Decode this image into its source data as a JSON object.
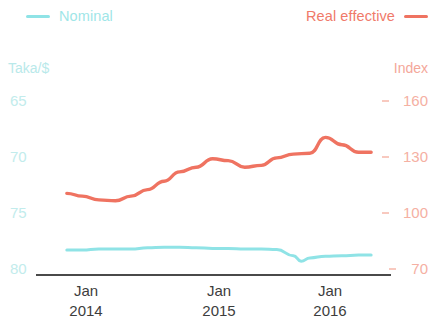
{
  "legend": {
    "nominal": {
      "label": "Nominal",
      "color": "#8fe3e6",
      "swatch": "line-swatch"
    },
    "real": {
      "label": "Real effective",
      "color": "#ef7361",
      "swatch": "line-swatch"
    }
  },
  "axes": {
    "left_title": "Taka/$",
    "right_title": "Index",
    "left_ticks": [
      "65",
      "70",
      "75",
      "80"
    ],
    "right_ticks": [
      "160",
      "130",
      "100",
      "70"
    ],
    "x_ticks": [
      {
        "month": "Jan",
        "year": "2014"
      },
      {
        "month": "Jan",
        "year": "2015"
      },
      {
        "month": "Jan",
        "year": "2016"
      }
    ]
  },
  "chart_data": {
    "type": "line",
    "title": "",
    "subtitle": "",
    "xlabel": "",
    "ylabel": "Taka/$",
    "y2label": "Index",
    "grid": false,
    "legend_position": "top",
    "x_tick_labels": [
      "Jan 2014",
      "Jan 2015",
      "Jan 2016"
    ],
    "x_tick_values": [
      2014.0,
      2015.0,
      2016.0
    ],
    "xlim": [
      2013.6,
      2016.85
    ],
    "ylim": [
      80,
      64
    ],
    "y2lim": [
      70,
      170
    ],
    "y_ticks": [
      65,
      70,
      75,
      80
    ],
    "y2_ticks": [
      70,
      100,
      130,
      160
    ],
    "y_axis_inverted": true,
    "series": [
      {
        "name": "Nominal",
        "axis": "left",
        "unit": "Taka/$",
        "color": "#8fe3e6",
        "x": [
          2013.67,
          2013.83,
          2014.0,
          2014.17,
          2014.33,
          2014.5,
          2014.67,
          2014.83,
          2015.0,
          2015.17,
          2015.33,
          2015.5,
          2015.67,
          2015.83,
          2016.0,
          2016.08,
          2016.17,
          2016.33,
          2016.5,
          2016.67,
          2016.8
        ],
        "values": [
          78.4,
          78.4,
          78.3,
          78.3,
          78.3,
          78.2,
          78.15,
          78.15,
          78.2,
          78.25,
          78.25,
          78.3,
          78.3,
          78.35,
          78.9,
          79.4,
          79.1,
          78.95,
          78.9,
          78.85,
          78.85
        ]
      },
      {
        "name": "Real effective",
        "axis": "right",
        "unit": "Index",
        "color": "#ef7361",
        "x": [
          2013.67,
          2013.83,
          2014.0,
          2014.17,
          2014.33,
          2014.5,
          2014.67,
          2014.83,
          2015.0,
          2015.17,
          2015.33,
          2015.5,
          2015.67,
          2015.83,
          2016.0,
          2016.17,
          2016.33,
          2016.5,
          2016.67,
          2016.8
        ],
        "values": [
          110.0,
          108.5,
          106.5,
          106.0,
          108.5,
          112.0,
          116.5,
          121.5,
          124.0,
          128.5,
          127.5,
          124.0,
          125.0,
          129.0,
          131.0,
          131.5,
          140.0,
          136.0,
          132.0,
          132.0
        ]
      }
    ]
  }
}
